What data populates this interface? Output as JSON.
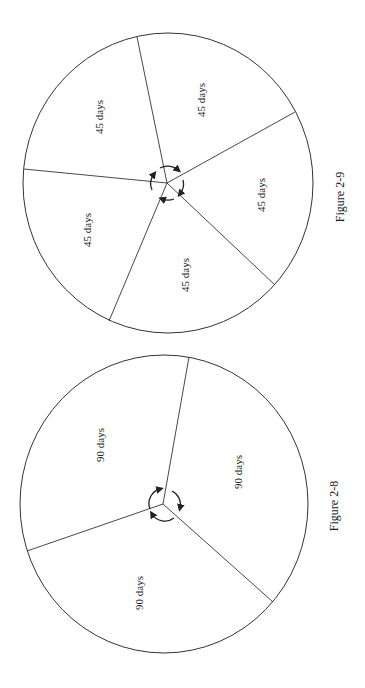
{
  "figures": [
    {
      "caption": "Figure 2-9",
      "segments": 5,
      "labels": [
        "45 days",
        "45 days",
        "45 days",
        "45 days",
        "45 days"
      ]
    },
    {
      "caption": "Figure 2-8",
      "segments": 3,
      "labels": [
        "90 days",
        "90 days",
        "90 days"
      ]
    }
  ],
  "colors": {
    "line": "#333333",
    "background": "#ffffff"
  }
}
